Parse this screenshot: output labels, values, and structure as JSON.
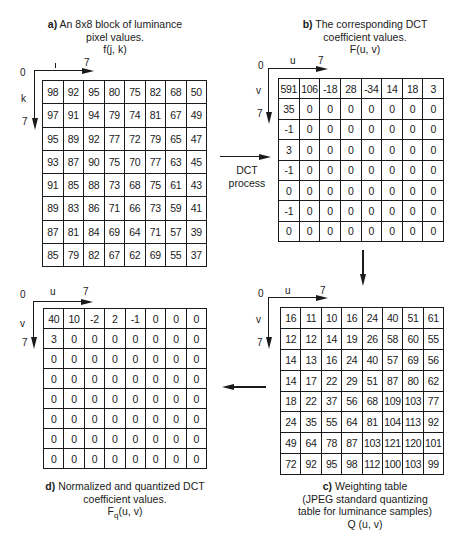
{
  "panels": {
    "a": {
      "caption_label": "a)",
      "caption_line1": "An 8x8 block of luminance",
      "caption_line2": "pixel values.",
      "caption_line3": "f(j, k)",
      "axis_origin": "0",
      "axis_x_label": "j",
      "axis_x_end": "7",
      "axis_y_label": "k",
      "axis_y_end": "7",
      "rows": [
        [
          "98",
          "92",
          "95",
          "80",
          "75",
          "82",
          "68",
          "50"
        ],
        [
          "97",
          "91",
          "94",
          "79",
          "74",
          "81",
          "67",
          "49"
        ],
        [
          "95",
          "89",
          "92",
          "77",
          "72",
          "79",
          "65",
          "47"
        ],
        [
          "93",
          "87",
          "90",
          "75",
          "70",
          "77",
          "63",
          "45"
        ],
        [
          "91",
          "85",
          "88",
          "73",
          "68",
          "75",
          "61",
          "43"
        ],
        [
          "89",
          "83",
          "86",
          "71",
          "66",
          "73",
          "59",
          "41"
        ],
        [
          "87",
          "81",
          "84",
          "69",
          "64",
          "71",
          "57",
          "39"
        ],
        [
          "85",
          "79",
          "82",
          "67",
          "62",
          "69",
          "55",
          "37"
        ]
      ]
    },
    "b": {
      "caption_label": "b)",
      "caption_line1": "The corresponding DCT",
      "caption_line2": "coefficient values.",
      "caption_line3": "F(u, v)",
      "axis_origin": "0",
      "axis_x_label": "u",
      "axis_x_end": "7",
      "axis_y_label": "v",
      "axis_y_end": "7",
      "rows": [
        [
          "591",
          "106",
          "-18",
          "28",
          "-34",
          "14",
          "18",
          "3"
        ],
        [
          "35",
          "0",
          "0",
          "0",
          "0",
          "0",
          "0",
          "0"
        ],
        [
          "-1",
          "0",
          "0",
          "0",
          "0",
          "0",
          "0",
          "0"
        ],
        [
          "3",
          "0",
          "0",
          "0",
          "0",
          "0",
          "0",
          "0"
        ],
        [
          "-1",
          "0",
          "0",
          "0",
          "0",
          "0",
          "0",
          "0"
        ],
        [
          "0",
          "0",
          "0",
          "0",
          "0",
          "0",
          "0",
          "0"
        ],
        [
          "-1",
          "0",
          "0",
          "0",
          "0",
          "0",
          "0",
          "0"
        ],
        [
          "0",
          "0",
          "0",
          "0",
          "0",
          "0",
          "0",
          "0"
        ]
      ]
    },
    "c": {
      "caption_label": "c)",
      "caption_line1": "Weighting table",
      "caption_line2": "(JPEG standard quantizing",
      "caption_line3": "table for luminance samples)",
      "caption_line4": "Q (u, v)",
      "axis_origin": "0",
      "axis_x_label": "u",
      "axis_x_end": "7",
      "axis_y_label": "v",
      "axis_y_end": "7",
      "rows": [
        [
          "16",
          "11",
          "10",
          "16",
          "24",
          "40",
          "51",
          "61"
        ],
        [
          "12",
          "12",
          "14",
          "19",
          "26",
          "58",
          "60",
          "55"
        ],
        [
          "14",
          "13",
          "16",
          "24",
          "40",
          "57",
          "69",
          "56"
        ],
        [
          "14",
          "17",
          "22",
          "29",
          "51",
          "87",
          "80",
          "62"
        ],
        [
          "18",
          "22",
          "37",
          "56",
          "68",
          "109",
          "103",
          "77"
        ],
        [
          "24",
          "35",
          "55",
          "64",
          "81",
          "104",
          "113",
          "92"
        ],
        [
          "49",
          "64",
          "78",
          "87",
          "103",
          "121",
          "120",
          "101"
        ],
        [
          "72",
          "92",
          "95",
          "98",
          "112",
          "100",
          "103",
          "99"
        ]
      ]
    },
    "d": {
      "caption_label": "d)",
      "caption_line1": "Normalized and quantized DCT",
      "caption_line2": "coefficient values.",
      "caption_line3_main": "F",
      "caption_line3_sub": "q",
      "caption_line3_rest": "(u, v)",
      "axis_origin": "0",
      "axis_x_label": "u",
      "axis_x_end": "7",
      "axis_y_label": "v",
      "axis_y_end": "7",
      "rows": [
        [
          "40",
          "10",
          "-2",
          "2",
          "-1",
          "0",
          "0",
          "0"
        ],
        [
          "3",
          "0",
          "0",
          "0",
          "0",
          "0",
          "0",
          "0"
        ],
        [
          "0",
          "0",
          "0",
          "0",
          "0",
          "0",
          "0",
          "0"
        ],
        [
          "0",
          "0",
          "0",
          "0",
          "0",
          "0",
          "0",
          "0"
        ],
        [
          "0",
          "0",
          "0",
          "0",
          "0",
          "0",
          "0",
          "0"
        ],
        [
          "0",
          "0",
          "0",
          "0",
          "0",
          "0",
          "0",
          "0"
        ],
        [
          "0",
          "0",
          "0",
          "0",
          "0",
          "0",
          "0",
          "0"
        ],
        [
          "0",
          "0",
          "0",
          "0",
          "0",
          "0",
          "0",
          "0"
        ]
      ]
    }
  },
  "flow": {
    "dct_label_line1": "DCT",
    "dct_label_line2": "process"
  }
}
